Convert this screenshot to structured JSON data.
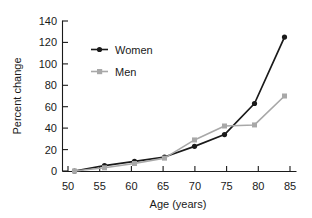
{
  "chart_data": {
    "type": "line",
    "title": "",
    "xlabel": "Age (years)",
    "ylabel": "Percent change",
    "x": [
      50,
      55,
      60,
      65,
      70,
      75,
      80,
      85
    ],
    "xlim": [
      48,
      87
    ],
    "ylim": [
      0,
      140
    ],
    "xticks": [
      "50",
      "55",
      "60",
      "65",
      "70",
      "75",
      "80",
      "85"
    ],
    "yticks": [
      "0",
      "20",
      "40",
      "60",
      "80",
      "100",
      "120",
      "140"
    ],
    "grid": false,
    "legend_position": "upper-left-inside",
    "series": [
      {
        "name": "Women",
        "color": "#1a1a1a",
        "marker": "circle",
        "values": [
          0,
          5,
          9,
          13,
          23,
          34,
          63,
          125
        ]
      },
      {
        "name": "Men",
        "color": "#a8a8a8",
        "marker": "square",
        "values": [
          0,
          3,
          7,
          12,
          29,
          42,
          43,
          70
        ]
      }
    ]
  },
  "legend": {
    "items": [
      {
        "label": "Women"
      },
      {
        "label": "Men"
      }
    ]
  },
  "axes": {
    "y_title": "Percent change",
    "x_title": "Age (years)",
    "y_tick_labels": [
      "140",
      "120",
      "100",
      "80",
      "60",
      "40",
      "20",
      "0"
    ],
    "x_tick_labels": [
      "50",
      "55",
      "60",
      "65",
      "70",
      "75",
      "80",
      "85"
    ]
  }
}
